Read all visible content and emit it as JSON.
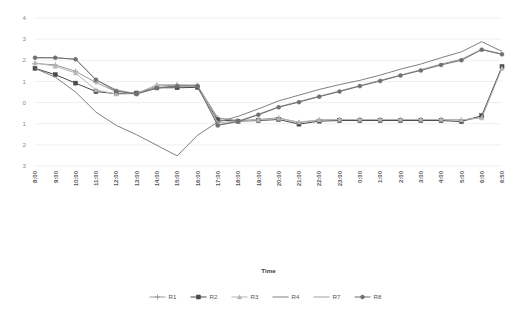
{
  "chart_data": {
    "type": "line",
    "title": "",
    "xlabel": "Time",
    "ylabel": "",
    "ylim": [
      -3,
      4
    ],
    "yticks": [
      4,
      3,
      2,
      1,
      0,
      -1,
      -2,
      -3
    ],
    "ytick_labels": [
      "4",
      "3",
      "2",
      "1",
      "0",
      "1",
      "2",
      "3"
    ],
    "grid": true,
    "legend_position": "bottom",
    "categories": [
      "8:00",
      "9:00",
      "10:00",
      "11:00",
      "12:00",
      "13:00",
      "14:00",
      "15:00",
      "16:00",
      "17:00",
      "18:00",
      "19:00",
      "20:00",
      "21:00",
      "22:00",
      "23:00",
      "0:00",
      "1:00",
      "2:00",
      "3:00",
      "4:00",
      "5:00",
      "6:00",
      "6:50"
    ],
    "series": [
      {
        "name": "R1",
        "color": "#9a9a9a",
        "marker": "cross",
        "values": [
          1.85,
          1.78,
          1.48,
          0.95,
          0.52,
          0.45,
          0.78,
          0.82,
          0.82,
          -0.72,
          -0.85,
          -0.8,
          -0.72,
          -0.95,
          -0.82,
          -0.8,
          -0.8,
          -0.8,
          -0.8,
          -0.8,
          -0.8,
          -0.82,
          -0.72,
          1.68
        ]
      },
      {
        "name": "R2",
        "color": "#4a4a4a",
        "marker": "square",
        "values": [
          1.62,
          1.32,
          0.92,
          0.52,
          0.42,
          0.45,
          0.7,
          0.7,
          0.72,
          -0.82,
          -0.88,
          -0.85,
          -0.8,
          -1.02,
          -0.88,
          -0.85,
          -0.85,
          -0.85,
          -0.85,
          -0.85,
          -0.85,
          -0.9,
          -0.62,
          1.7
        ]
      },
      {
        "name": "R3",
        "color": "#b5b5b5",
        "marker": "triangle",
        "values": [
          1.88,
          1.72,
          1.4,
          0.6,
          0.4,
          0.42,
          0.85,
          0.85,
          0.82,
          -0.95,
          -0.88,
          -0.82,
          -0.75,
          -0.92,
          -0.82,
          -0.8,
          -0.8,
          -0.8,
          -0.8,
          -0.8,
          -0.8,
          -0.82,
          -0.72,
          1.62
        ]
      },
      {
        "name": "R4",
        "color": "#808080",
        "marker": "none",
        "values": [
          1.62,
          1.2,
          0.5,
          -0.45,
          -1.08,
          -1.52,
          -2.02,
          -2.52,
          -1.55,
          -0.92,
          -0.65,
          -0.3,
          0.08,
          0.35,
          0.62,
          0.85,
          1.05,
          1.3,
          1.58,
          1.82,
          2.12,
          2.4,
          2.88,
          2.42
        ]
      },
      {
        "name": "R7",
        "color": "#9e9e9e",
        "marker": "none",
        "values": [
          2.12,
          2.12,
          2.05,
          1.08,
          0.6,
          0.42,
          0.7,
          0.8,
          0.8,
          -1.05,
          -0.88,
          -0.55,
          -0.2,
          0.05,
          0.3,
          0.55,
          0.8,
          1.05,
          1.3,
          1.55,
          1.82,
          2.05,
          2.52,
          2.3
        ]
      },
      {
        "name": "R8",
        "color": "#707070",
        "marker": "circle",
        "values": [
          2.12,
          2.12,
          2.05,
          1.08,
          0.55,
          0.4,
          0.68,
          0.78,
          0.78,
          -1.08,
          -0.9,
          -0.58,
          -0.22,
          0.02,
          0.28,
          0.52,
          0.78,
          1.02,
          1.28,
          1.52,
          1.78,
          2.0,
          2.5,
          2.28
        ]
      }
    ]
  },
  "legend": {
    "items": [
      {
        "label": "R1"
      },
      {
        "label": "R2"
      },
      {
        "label": "R3"
      },
      {
        "label": "R4"
      },
      {
        "label": "R7"
      },
      {
        "label": "R8"
      }
    ]
  },
  "axis": {
    "x_title": "Time"
  }
}
